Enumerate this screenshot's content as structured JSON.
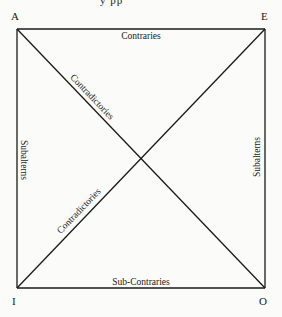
{
  "diagram": {
    "title_fragment": "y  pp",
    "corners": {
      "top_left": "A",
      "top_right": "E",
      "bottom_left": "I",
      "bottom_right": "O"
    },
    "relations": {
      "top": "Contraries",
      "bottom": "Sub-Contraries",
      "left": "Subalterns",
      "right": "Subalterns",
      "diagonal_a_o": "Contradictories",
      "diagonal_i_e": "Contradictories"
    },
    "colors": {
      "line": "#1a1a1a",
      "background": "#fbfbf9"
    }
  }
}
